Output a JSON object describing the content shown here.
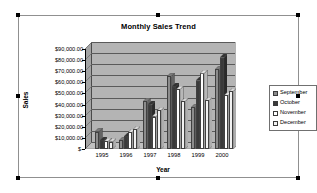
{
  "chart_data": {
    "type": "bar",
    "title": "Monthly Sales Trend",
    "xlabel": "Year",
    "ylabel": "Sales",
    "categories": [
      "1995",
      "1996",
      "1997",
      "1998",
      "1999",
      "2000"
    ],
    "series": [
      {
        "name": "September",
        "color": "#8c8c8c",
        "values": [
          15500,
          8000,
          43000,
          65500,
          37500,
          72000
        ]
      },
      {
        "name": "October",
        "color": "#3a3a3a",
        "values": [
          8000,
          11500,
          40000,
          56000,
          61500,
          82000
        ]
      },
      {
        "name": "November",
        "color": "#ffffff",
        "values": [
          7000,
          15000,
          29000,
          54000,
          68000,
          48500
        ]
      },
      {
        "name": "December",
        "color": "#f2f2f2",
        "values": [
          6500,
          18000,
          35000,
          43000,
          44000,
          52000
        ]
      }
    ],
    "ylim": [
      0,
      90000
    ],
    "ytick_values": [
      0,
      10000,
      20000,
      30000,
      40000,
      50000,
      60000,
      70000,
      80000,
      90000
    ],
    "ytick_labels": [
      "$-",
      "$10,000.00",
      "$20,000.00",
      "$30,000.00",
      "$40,000.00",
      "$50,000.00",
      "$60,000.00",
      "$70,000.00",
      "$80,000.00",
      "$90,000.00"
    ],
    "grid": true,
    "legend_position": "right",
    "plot_area_color": "#b4b4b4",
    "gridline_color": "#5a5a5a",
    "is_3d": true
  },
  "legend": {
    "items": [
      {
        "label": "September"
      },
      {
        "label": "October"
      },
      {
        "label": "November"
      },
      {
        "label": "December"
      }
    ]
  },
  "selection": {
    "handles": 8
  }
}
